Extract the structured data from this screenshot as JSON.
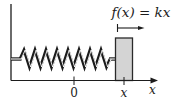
{
  "diagram": {
    "force_label": "f(x) = kx",
    "axis": {
      "origin_tick_label": "0",
      "position_tick_label": "x",
      "axis_label": "x"
    },
    "colors": {
      "line": "#1c1c1c",
      "block_fill": "#d4d4d4",
      "block_border": "#2a2a2a",
      "background": "#ffffff"
    }
  }
}
